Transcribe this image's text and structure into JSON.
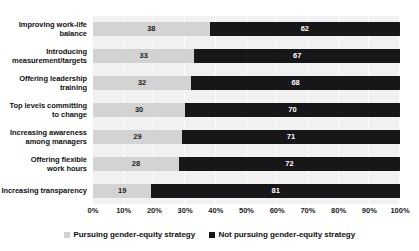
{
  "chart_data": {
    "type": "bar",
    "orientation": "horizontal",
    "stacked": true,
    "stack_total": 100,
    "title": "",
    "xlabel": "",
    "ylabel": "",
    "xlim": [
      0,
      100
    ],
    "grid": true,
    "legend_position": "bottom",
    "categories": [
      "Improving work-life balance",
      "Introducing measurement/targets",
      "Offering leadership training",
      "Top levels committing to change",
      "Increasing awareness among managers",
      "Offering flexible work hours",
      "Increasing transparency"
    ],
    "category_lines": [
      [
        "Improving work-life",
        "balance"
      ],
      [
        "Introducing",
        "measurement/targets"
      ],
      [
        "Offering leadership",
        "training"
      ],
      [
        "Top levels committing",
        "to change"
      ],
      [
        "Increasing awareness",
        "among managers"
      ],
      [
        "Offering flexible",
        "work hours"
      ],
      [
        "Increasing transparency"
      ]
    ],
    "tick_labels": [
      "0%",
      "10%",
      "20%",
      "30%",
      "40%",
      "50%",
      "60%",
      "70%",
      "80%",
      "90%",
      "100%"
    ],
    "tick_values": [
      0,
      10,
      20,
      30,
      40,
      50,
      60,
      70,
      80,
      90,
      100
    ],
    "series": [
      {
        "name": "Pursuing gender-equity strategy",
        "color": "#d3d3d3",
        "values": [
          38,
          33,
          32,
          30,
          29,
          28,
          19
        ]
      },
      {
        "name": "Not pursuing gender-equity strategy",
        "color": "#17171a",
        "values": [
          62,
          67,
          68,
          70,
          71,
          72,
          81
        ]
      }
    ]
  },
  "legend": {
    "items": [
      {
        "label": "Pursuing gender-equity strategy",
        "swatch": "light-gray-square"
      },
      {
        "label": "Not pursuing gender-equity strategy",
        "swatch": "black-square"
      }
    ]
  },
  "colors": {
    "series_light": "#d3d3d3",
    "series_dark": "#17171a",
    "plot_background": "#f1f1f1",
    "gridline": "#ffffff",
    "text": "#111111"
  }
}
